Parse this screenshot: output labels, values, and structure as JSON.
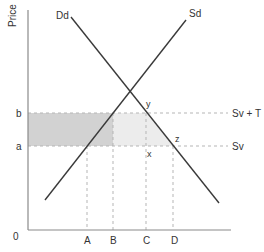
{
  "diagram": {
    "axis": {
      "y_label": "Price",
      "origin_label": "0"
    },
    "curves": {
      "demand_label": "Dd",
      "supply_label": "Sd"
    },
    "price_levels": {
      "b_label": "b",
      "a_label": "a",
      "upper_line_label": "Sv + T",
      "lower_line_label": "Sv"
    },
    "points": {
      "y_label": "y",
      "z_label": "z",
      "x_label": "x"
    },
    "quantities": {
      "A": "A",
      "B": "B",
      "C": "C",
      "D": "D"
    },
    "colors": {
      "axis": "#8a8a8a",
      "curve": "#3a3a3a",
      "dashed": "#b5b5b5",
      "dark_shade": "#d2d2d2",
      "light_shade": "#ececec",
      "text": "#333333"
    }
  }
}
